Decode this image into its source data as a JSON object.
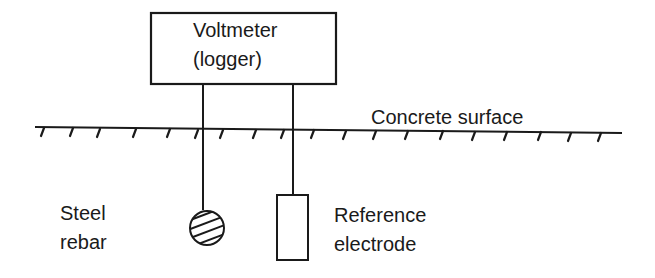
{
  "diagram": {
    "meter": {
      "line1": "Voltmeter",
      "line2": "(logger)"
    },
    "surface_label": "Concrete surface",
    "rebar": {
      "line1": "Steel",
      "line2": "rebar"
    },
    "electrode": {
      "line1": "Reference",
      "line2": "electrode"
    },
    "colors": {
      "ink": "#1a1a1a",
      "background": "#ffffff"
    }
  }
}
